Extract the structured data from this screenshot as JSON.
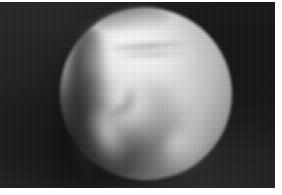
{
  "plate": {
    "width_px": 282,
    "height_px": 195,
    "background_color": "#ffffff",
    "caption": ""
  },
  "image_frame": {
    "name": "astronomical-image-frame",
    "left_px": 0,
    "top_px": 2,
    "width_px": 275,
    "height_px": 186,
    "sky_color": "#161616",
    "medium": "grayscale",
    "alt_text": "Grayscale telescopic image of a partially illuminated planetary body showing bright cloud features against a dark sky"
  },
  "subject": {
    "name": "planetary-disc",
    "phase": "gibbous",
    "illuminated_side": "right",
    "disc_center_x_px": 146,
    "disc_center_y_px": 92,
    "disc_radius_px": 86,
    "limb_color_bright": "#fbfbfb",
    "limb_color_edge": "#262626"
  },
  "features": [
    {
      "id": "upper-lobe",
      "label": "bright upper lobe",
      "brightness": "very-bright",
      "center_x_px": 140,
      "center_y_px": 48,
      "color": "#ffffff"
    },
    {
      "id": "bright-wedge",
      "label": "bright descending wedge",
      "brightness": "bright",
      "center_x_px": 130,
      "center_y_px": 105,
      "color": "#fafafa"
    },
    {
      "id": "bright-tail",
      "label": "fading lower-left tail",
      "brightness": "medium",
      "center_x_px": 110,
      "center_y_px": 141,
      "color": "#ececec"
    },
    {
      "id": "limb-sliver",
      "label": "lower-right limb sliver",
      "brightness": "medium",
      "center_x_px": 197,
      "center_y_px": 147,
      "color": "#e2e2e2"
    },
    {
      "id": "upper-left-glow",
      "label": "faint upper-left glow",
      "brightness": "faint",
      "center_x_px": 94,
      "center_y_px": 49,
      "color": "#d2d2d2"
    }
  ],
  "lineaments": [
    {
      "id": "top-cap",
      "label": "dark cap along top of bright zone",
      "tone": "#5c5c5c"
    },
    {
      "id": "band-a",
      "label": "upper dark horizontal band",
      "tone": "#8c8c8c"
    },
    {
      "id": "band-b",
      "label": "lower dark horizontal band",
      "tone": "#969696"
    },
    {
      "id": "central-notch",
      "label": "central dark notch",
      "tone": "#808080"
    },
    {
      "id": "mid-groove",
      "label": "mid dark groove",
      "tone": "#787878"
    },
    {
      "id": "terminator",
      "label": "shadowed terminator boundary",
      "tone": "#121212"
    }
  ],
  "margins": {
    "top_px": 2,
    "right_px": 7,
    "bottom_px": 7,
    "left_px": 0,
    "color": "#ffffff"
  }
}
